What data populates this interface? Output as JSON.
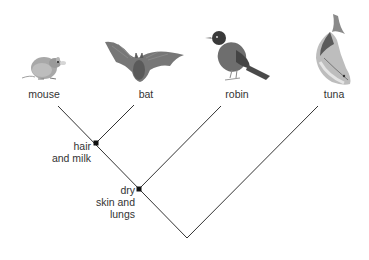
{
  "diagram": {
    "type": "cladogram",
    "colors": {
      "line": "#333333",
      "node": "#111111",
      "text": "#333333",
      "background": "#ffffff"
    },
    "taxa": [
      {
        "id": "mouse",
        "label": "mouse",
        "icon": "mouse-illustration"
      },
      {
        "id": "bat",
        "label": "bat",
        "icon": "bat-illustration"
      },
      {
        "id": "robin",
        "label": "robin",
        "icon": "robin-illustration"
      },
      {
        "id": "tuna",
        "label": "tuna",
        "icon": "tuna-illustration"
      }
    ],
    "traits": [
      {
        "id": "hair-and-milk",
        "lines": [
          "hair",
          "and milk"
        ],
        "groups": [
          "mouse",
          "bat"
        ]
      },
      {
        "id": "dry-skin-and-lungs",
        "lines": [
          "dry",
          "skin and",
          "lungs"
        ],
        "groups": [
          "mouse",
          "bat",
          "robin"
        ]
      }
    ]
  }
}
